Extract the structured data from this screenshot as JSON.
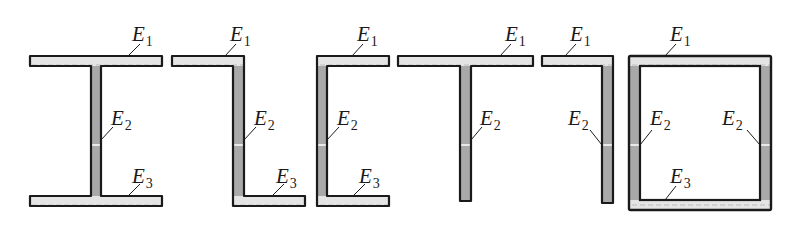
{
  "diagram": {
    "title": "",
    "colors": {
      "outline": "#1a1a1a",
      "flange_fill": "#e4e4e4",
      "flange_stripe": "#c8c8c8",
      "web_fill": "#a9a9a9",
      "background": "#ffffff"
    },
    "sections": [
      {
        "name": "i-section",
        "parts": [
          {
            "role": "E1",
            "x": 30,
            "y": 56,
            "w": 132,
            "h": 10,
            "kind": "flange"
          },
          {
            "role": "E2",
            "x": 91,
            "y": 66,
            "w": 10,
            "h": 130,
            "kind": "web"
          },
          {
            "role": "E3",
            "x": 30,
            "y": 196,
            "w": 132,
            "h": 10,
            "kind": "flange"
          }
        ],
        "outline": "30,56 162,56 162,66 101,66 101,196 162,196 162,206 30,206 30,196 91,196 91,66 30,66",
        "labels": [
          {
            "base": "E",
            "sub": "1",
            "x": 132,
            "y": 24,
            "lx1": 128,
            "ly1": 56,
            "lx2": 140,
            "ly2": 44
          },
          {
            "base": "E",
            "sub": "2",
            "x": 111,
            "y": 108,
            "lx1": 101,
            "ly1": 140,
            "lx2": 113,
            "ly2": 127
          },
          {
            "base": "E",
            "sub": "3",
            "x": 132,
            "y": 166,
            "lx1": 128,
            "ly1": 196,
            "lx2": 140,
            "ly2": 184
          }
        ],
        "split_y": 145
      },
      {
        "name": "z-section",
        "parts": [
          {
            "role": "E1",
            "x": 172,
            "y": 56,
            "w": 72,
            "h": 10,
            "kind": "flange"
          },
          {
            "role": "E2",
            "x": 233,
            "y": 56,
            "w": 11,
            "h": 150,
            "kind": "web"
          },
          {
            "role": "E3",
            "x": 233,
            "y": 196,
            "w": 72,
            "h": 10,
            "kind": "flange"
          }
        ],
        "outline": "172,56 244,56 244,196 305,196 305,206 233,206 233,66 172,66",
        "labels": [
          {
            "base": "E",
            "sub": "1",
            "x": 230,
            "y": 24,
            "lx1": 225,
            "ly1": 56,
            "lx2": 236,
            "ly2": 44
          },
          {
            "base": "E",
            "sub": "2",
            "x": 254,
            "y": 108,
            "lx1": 244,
            "ly1": 140,
            "lx2": 256,
            "ly2": 127
          },
          {
            "base": "E",
            "sub": "3",
            "x": 276,
            "y": 166,
            "lx1": 272,
            "ly1": 196,
            "lx2": 284,
            "ly2": 184
          }
        ],
        "split_y": 145
      },
      {
        "name": "c-section",
        "parts": [
          {
            "role": "E1",
            "x": 317,
            "y": 56,
            "w": 72,
            "h": 10,
            "kind": "flange"
          },
          {
            "role": "E2",
            "x": 317,
            "y": 56,
            "w": 10,
            "h": 150,
            "kind": "web"
          },
          {
            "role": "E3",
            "x": 317,
            "y": 196,
            "w": 72,
            "h": 10,
            "kind": "flange"
          }
        ],
        "outline": "317,56 389,56 389,66 327,66 327,196 389,196 389,206 317,206",
        "labels": [
          {
            "base": "E",
            "sub": "1",
            "x": 357,
            "y": 24,
            "lx1": 352,
            "ly1": 56,
            "lx2": 363,
            "ly2": 44
          },
          {
            "base": "E",
            "sub": "2",
            "x": 337,
            "y": 108,
            "lx1": 327,
            "ly1": 140,
            "lx2": 339,
            "ly2": 127
          },
          {
            "base": "E",
            "sub": "3",
            "x": 359,
            "y": 166,
            "lx1": 353,
            "ly1": 196,
            "lx2": 365,
            "ly2": 184
          }
        ],
        "split_y": 145
      },
      {
        "name": "t-section",
        "parts": [
          {
            "role": "E1",
            "x": 398,
            "y": 56,
            "w": 135,
            "h": 10,
            "kind": "flange"
          },
          {
            "role": "E2",
            "x": 460,
            "y": 66,
            "w": 11,
            "h": 135,
            "kind": "web"
          }
        ],
        "outline": "398,56 533,56 533,66 471,66 471,201 460,201 460,66 398,66",
        "labels": [
          {
            "base": "E",
            "sub": "1",
            "x": 505,
            "y": 24,
            "lx1": 500,
            "ly1": 56,
            "lx2": 511,
            "ly2": 44
          },
          {
            "base": "E",
            "sub": "2",
            "x": 480,
            "y": 108,
            "lx1": 471,
            "ly1": 140,
            "lx2": 482,
            "ly2": 127
          }
        ],
        "split_y": 145
      },
      {
        "name": "l-section",
        "parts": [
          {
            "role": "E1",
            "x": 542,
            "y": 56,
            "w": 71,
            "h": 10,
            "kind": "flange"
          },
          {
            "role": "E2",
            "x": 602,
            "y": 56,
            "w": 11,
            "h": 147,
            "kind": "web"
          }
        ],
        "outline": "542,56 613,56 613,203 602,203 602,66 542,66",
        "labels": [
          {
            "base": "E",
            "sub": "1",
            "x": 570,
            "y": 24,
            "lx1": 565,
            "ly1": 56,
            "lx2": 576,
            "ly2": 44
          },
          {
            "base": "E",
            "sub": "2",
            "x": 568,
            "y": 108,
            "lx1": 602,
            "ly1": 145,
            "lx2": 590,
            "ly2": 130
          }
        ],
        "split_y": 145
      },
      {
        "name": "box-section",
        "parts": [
          {
            "role": "E1",
            "x": 629,
            "y": 56,
            "w": 142,
            "h": 10,
            "kind": "flange"
          },
          {
            "role": "E2",
            "x": 629,
            "y": 56,
            "w": 11,
            "h": 154,
            "kind": "web"
          },
          {
            "role": "E2",
            "x": 760,
            "y": 56,
            "w": 11,
            "h": 154,
            "kind": "web"
          },
          {
            "role": "E3",
            "x": 629,
            "y": 200,
            "w": 142,
            "h": 10,
            "kind": "flange"
          }
        ],
        "outline_outer": {
          "x": 629,
          "y": 56,
          "w": 142,
          "h": 154
        },
        "outline_inner": {
          "x": 640,
          "y": 66,
          "w": 120,
          "h": 134
        },
        "labels": [
          {
            "base": "E",
            "sub": "1",
            "x": 670,
            "y": 24,
            "lx1": 665,
            "ly1": 56,
            "lx2": 676,
            "ly2": 44
          },
          {
            "base": "E",
            "sub": "2",
            "x": 650,
            "y": 108,
            "lx1": 640,
            "ly1": 145,
            "lx2": 652,
            "ly2": 130
          },
          {
            "base": "E",
            "sub": "2",
            "x": 722,
            "y": 108,
            "lx1": 760,
            "ly1": 145,
            "lx2": 747,
            "ly2": 130
          },
          {
            "base": "E",
            "sub": "3",
            "x": 670,
            "y": 166,
            "lx1": 665,
            "ly1": 200,
            "lx2": 676,
            "ly2": 186
          }
        ],
        "split_y": 145
      }
    ]
  }
}
